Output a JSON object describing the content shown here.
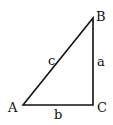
{
  "diagram": {
    "type": "right-triangle",
    "vertices": [
      {
        "id": "A",
        "label": "A",
        "x": 23,
        "y": 105
      },
      {
        "id": "B",
        "label": "B",
        "x": 93,
        "y": 18
      },
      {
        "id": "C",
        "label": "C",
        "x": 93,
        "y": 105
      }
    ],
    "sides": [
      {
        "id": "a",
        "label": "a",
        "from": "B",
        "to": "C"
      },
      {
        "id": "b",
        "label": "b",
        "from": "A",
        "to": "C"
      },
      {
        "id": "c",
        "label": "c",
        "from": "A",
        "to": "B"
      }
    ],
    "right_angle_at": "C",
    "stroke_color": "#111111"
  }
}
